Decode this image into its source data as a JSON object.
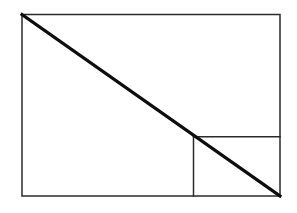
{
  "figure": {
    "background_color": "#ffffff",
    "canvas": {
      "width": 297,
      "height": 213
    },
    "style": {
      "outline_color": "#2b2b2b",
      "outline_width": 1.5,
      "divider_color": "#2b2b2b",
      "divider_width": 1.5,
      "diagonal_color": "#0d0d0d",
      "diagonal_width": 3.1
    },
    "shapes": {
      "outer_rectangle": {
        "name": "outer-rectangle",
        "x": 22,
        "y": 14.5,
        "width": 258,
        "height": 181.5,
        "right": 280,
        "bottom": 196
      },
      "diagonal": {
        "name": "main-diagonal",
        "x1": 22,
        "y1": 14.5,
        "x2": 280,
        "y2": 196
      },
      "inner_rectangle": {
        "name": "inner-rectangle",
        "x": 193.5,
        "y": 136.8,
        "width": 86.5,
        "height": 59.2,
        "right": 280,
        "bottom": 196,
        "corner_on_diagonal": true
      },
      "inner_top_edge": {
        "name": "inner-rectangle-top-edge",
        "x1": 193.5,
        "y1": 136.8,
        "x2": 280,
        "y2": 136.8
      },
      "inner_left_edge": {
        "name": "inner-rectangle-left-edge",
        "x1": 193.5,
        "y1": 136.8,
        "x2": 193.5,
        "y2": 196
      }
    }
  }
}
